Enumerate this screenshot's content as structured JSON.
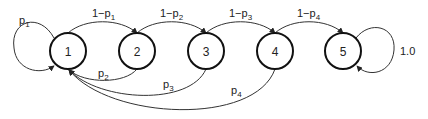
{
  "diagram": {
    "type": "markov-chain",
    "nodes": [
      {
        "id": "1",
        "label": "1",
        "cx": 68,
        "cy": 51
      },
      {
        "id": "2",
        "label": "2",
        "cx": 137,
        "cy": 51
      },
      {
        "id": "3",
        "label": "3",
        "cx": 206,
        "cy": 51
      },
      {
        "id": "4",
        "label": "4",
        "cx": 275,
        "cy": 51
      },
      {
        "id": "5",
        "label": "5",
        "cx": 343,
        "cy": 51
      }
    ],
    "edges": [
      {
        "from": "1",
        "to": "1",
        "label_main": "p",
        "label_sub": "1",
        "kind": "self-loop"
      },
      {
        "from": "1",
        "to": "2",
        "label_main": "1−p",
        "label_sub": "1",
        "kind": "forward"
      },
      {
        "from": "2",
        "to": "3",
        "label_main": "1−p",
        "label_sub": "2",
        "kind": "forward"
      },
      {
        "from": "3",
        "to": "4",
        "label_main": "1−p",
        "label_sub": "3",
        "kind": "forward"
      },
      {
        "from": "4",
        "to": "5",
        "label_main": "1−p",
        "label_sub": "4",
        "kind": "forward"
      },
      {
        "from": "2",
        "to": "1",
        "label_main": "p",
        "label_sub": "2",
        "kind": "back"
      },
      {
        "from": "3",
        "to": "1",
        "label_main": "p",
        "label_sub": "3",
        "kind": "back"
      },
      {
        "from": "4",
        "to": "1",
        "label_main": "p",
        "label_sub": "4",
        "kind": "back"
      },
      {
        "from": "5",
        "to": "5",
        "label_main": "1.0",
        "label_sub": "",
        "kind": "self-loop"
      }
    ]
  }
}
